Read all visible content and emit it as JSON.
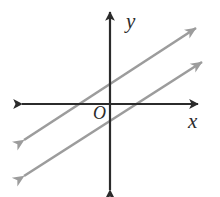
{
  "figure": {
    "title": "",
    "type": "coordinate-plane-diagram",
    "width": 220,
    "height": 197,
    "background_color": "#ffffff"
  },
  "labels": {
    "y_axis": "y",
    "x_axis": "x",
    "origin": "O"
  },
  "colors": {
    "axis": "#2b2b2b",
    "line": "#9c9c9c",
    "label": "#2b2b2b",
    "background": "#ffffff"
  },
  "chart_data": {
    "type": "line",
    "title": "",
    "xlabel": "x",
    "ylabel": "y",
    "origin_label": "O",
    "grid": false,
    "legend": null,
    "axes": {
      "origin_px": [
        110,
        104
      ],
      "x_axis": {
        "label": "x",
        "from_px": [
          22,
          104
        ],
        "to_px": [
          198,
          104
        ],
        "arrows": "both",
        "tick_labels": []
      },
      "y_axis": {
        "label": "y",
        "from_px": [
          110,
          190
        ],
        "to_px": [
          110,
          12
        ],
        "arrows": "both",
        "tick_labels": []
      }
    },
    "series": [
      {
        "name": "line-1",
        "description": "upper parallel line",
        "color": "#9c9c9c",
        "slope": 0.65,
        "y_intercept_px": 84,
        "x_intercept_px": 85,
        "arrows": "both",
        "endpoints_px": [
          [
            24,
            140
          ],
          [
            196,
            28
          ]
        ]
      },
      {
        "name": "line-2",
        "description": "lower parallel line",
        "color": "#9c9c9c",
        "slope": 0.65,
        "y_intercept_px": 121,
        "x_intercept_px": 130,
        "arrows": "both",
        "endpoints_px": [
          [
            24,
            176
          ],
          [
            202,
            62
          ]
        ]
      }
    ],
    "relationship": "parallel"
  }
}
